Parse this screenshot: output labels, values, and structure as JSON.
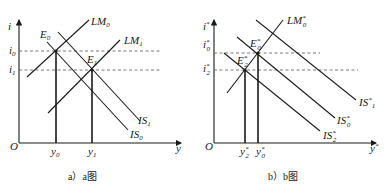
{
  "panels": [
    {
      "id": "a",
      "caption": "a）a图",
      "axes": {
        "y_label": "i",
        "x_label": "y",
        "origin_label": "O"
      },
      "rate_levels": [
        {
          "label": "i",
          "sub": "0"
        },
        {
          "label": "i",
          "sub": "1"
        }
      ],
      "curves": {
        "LM0": {
          "label": "LM",
          "sub": "0"
        },
        "LM1": {
          "label": "LM",
          "sub": "1"
        },
        "IS0": {
          "label": "IS",
          "sub": "0"
        },
        "IS1": {
          "label": "IS",
          "sub": "1"
        }
      },
      "points": [
        {
          "label": "E",
          "sub": "0"
        },
        {
          "label": "E",
          "sub": "1"
        }
      ],
      "outputs": [
        {
          "label": "y",
          "sub": "0"
        },
        {
          "label": "y",
          "sub": "1"
        }
      ]
    },
    {
      "id": "b",
      "caption": "b）b图",
      "axes": {
        "y_label": "i",
        "y_sup": "*",
        "x_label": "y",
        "x_sup": "*",
        "origin_label": "O"
      },
      "rate_levels": [
        {
          "label": "i",
          "sup": "*",
          "sub": "0"
        },
        {
          "label": "i",
          "sup": "*",
          "sub": "2"
        }
      ],
      "curves": {
        "LM0": {
          "label": "LM",
          "sup": "*",
          "sub": "0"
        },
        "IS1": {
          "label": "IS",
          "sup": "*",
          "sub": "1"
        },
        "IS0": {
          "label": "IS",
          "sup": "*",
          "sub": "0"
        },
        "IS2": {
          "label": "IS",
          "sup": "*",
          "sub": "2"
        }
      },
      "points": [
        {
          "label": "E",
          "sup": "*",
          "sub": "0"
        },
        {
          "label": "E",
          "sup": "*",
          "sub": "2"
        }
      ],
      "outputs": [
        {
          "label": "y",
          "sup": "*",
          "sub": "2"
        },
        {
          "label": "y",
          "sup": "*",
          "sub": "0"
        }
      ]
    }
  ]
}
